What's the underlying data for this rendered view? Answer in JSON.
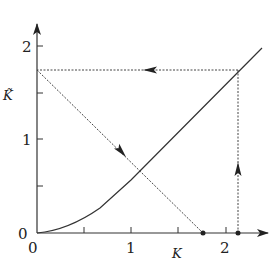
{
  "diagram": {
    "type": "cobweb",
    "x_axis": {
      "label": "K",
      "ticks": [
        {
          "value": 0,
          "label": "0"
        },
        {
          "value": 0.5,
          "label": ""
        },
        {
          "value": 1,
          "label": "1"
        },
        {
          "value": 1.5,
          "label": ""
        },
        {
          "value": 2,
          "label": "2"
        }
      ]
    },
    "y_axis": {
      "label": "K̃",
      "origin_label": "0",
      "ticks": [
        {
          "value": 0.5,
          "label": ""
        },
        {
          "value": 1,
          "label": "1"
        },
        {
          "value": 1.5,
          "label": ""
        },
        {
          "value": 2,
          "label": "2"
        }
      ]
    },
    "curve": {
      "description": "solid curve through origin, convex near 0 then nearly linear",
      "points": [
        [
          0,
          0
        ],
        [
          0.25,
          0.04
        ],
        [
          0.5,
          0.17
        ],
        [
          0.75,
          0.36
        ],
        [
          1.0,
          0.6
        ],
        [
          1.25,
          0.85
        ],
        [
          1.5,
          1.11
        ],
        [
          1.75,
          1.36
        ],
        [
          2.0,
          1.62
        ],
        [
          2.4,
          1.97
        ]
      ]
    },
    "dashed_lines": [
      {
        "name": "vertical-dashed",
        "from": [
          2.13,
          0
        ],
        "to": [
          2.13,
          1.74
        ],
        "arrow": "up"
      },
      {
        "name": "horizontal-dashed",
        "from": [
          2.13,
          1.74
        ],
        "to": [
          0,
          1.74
        ],
        "arrow": "left"
      },
      {
        "name": "diagonal-dashed",
        "from": [
          0,
          1.74
        ],
        "to": [
          1.77,
          0
        ],
        "arrow": "down-right"
      }
    ],
    "points": [
      {
        "name": "start-point",
        "x": 2.13,
        "y": 0
      },
      {
        "name": "end-point",
        "x": 1.77,
        "y": 0
      }
    ],
    "colors": {
      "line": "#333333",
      "background": "#ffffff"
    }
  }
}
